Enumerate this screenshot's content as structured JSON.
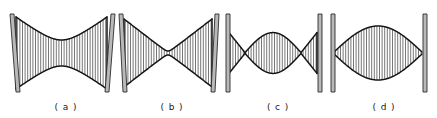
{
  "figure": {
    "background_color": "#ffffff",
    "width": 437,
    "height": 118,
    "mirror_color": "#b9b9b9",
    "mirror_stroke_color": "#2b2b2b",
    "beam_stroke_color": "#141414",
    "hatch_color": "#4a4a4a"
  },
  "panels": [
    {
      "id": "panel-a",
      "label": "( a )",
      "label_x": 66,
      "label_y": 110,
      "beam_type": "wide-waist-hyperbolic",
      "description": "Large stable mode with broad central waist, nearly filling both mirrors",
      "left_mirror": {
        "x": 13,
        "y_top": 14,
        "y_bottom": 92,
        "width": 4,
        "tilt": -3
      },
      "right_mirror": {
        "x": 108,
        "y_top": 14,
        "y_bottom": 92,
        "width": 4,
        "tilt": 3
      },
      "beam": {
        "x_start": 16,
        "x_end": 107,
        "center_y": 53,
        "edge_half_width": 36,
        "waist_half_width": 13,
        "crossing": false
      },
      "hatch_spacing": 2.6
    },
    {
      "id": "panel-b",
      "label": "( b )",
      "label_x": 172,
      "label_y": 110,
      "beam_type": "narrow-waist-hyperbolic",
      "description": "Confocal-like mode pinched to a small central waist",
      "left_mirror": {
        "x": 121,
        "y_top": 14,
        "y_bottom": 92,
        "width": 4,
        "tilt": -2
      },
      "right_mirror": {
        "x": 213,
        "y_top": 14,
        "y_bottom": 92,
        "width": 4,
        "tilt": 2
      },
      "beam": {
        "x_start": 124,
        "x_end": 212,
        "center_y": 53,
        "edge_half_width": 34,
        "waist_half_width": 2,
        "crossing": false
      },
      "hatch_spacing": 2.6
    },
    {
      "id": "panel-c",
      "label": "( c )",
      "label_x": 278,
      "label_y": 110,
      "beam_type": "crossed-double-focus",
      "description": "Unstable/concentric mode crossing at two internal foci with a lenticular central lobe",
      "left_mirror": {
        "x": 226,
        "y_top": 14,
        "y_bottom": 92,
        "width": 4,
        "tilt": 0
      },
      "right_mirror": {
        "x": 318,
        "y_top": 14,
        "y_bottom": 92,
        "width": 4,
        "tilt": 0
      },
      "beam": {
        "x_start": 229,
        "x_end": 317,
        "center_y": 53,
        "edge_half_width": 20,
        "focus_offset": 16,
        "lobe_half_width": 20,
        "crossing": true
      },
      "hatch_spacing": 2.6
    },
    {
      "id": "panel-d",
      "label": "( d )",
      "label_x": 384,
      "label_y": 110,
      "beam_type": "lenticular-point-to-point",
      "description": "Concentric mode focused to points on both mirrors with a large lens-shaped lobe",
      "left_mirror": {
        "x": 331,
        "y_top": 14,
        "y_bottom": 92,
        "width": 4,
        "tilt": 0
      },
      "right_mirror": {
        "x": 423,
        "y_top": 14,
        "y_bottom": 92,
        "width": 4,
        "tilt": 0
      },
      "beam": {
        "x_start": 334,
        "x_end": 422,
        "center_y": 53,
        "edge_half_width": 1,
        "lobe_half_width": 27,
        "crossing": false
      },
      "hatch_spacing": 2.6
    }
  ]
}
